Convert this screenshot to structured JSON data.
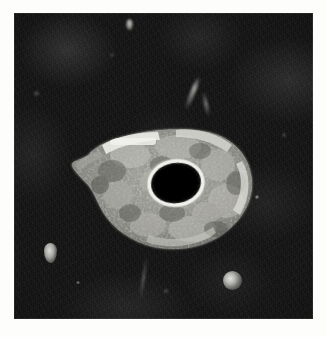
{
  "figure": {
    "domain": "Natural-Image",
    "kind": "grayscale-photomicrograph",
    "caption": "",
    "plate": {
      "left": 14,
      "top": 13,
      "width": 299,
      "height": 306,
      "page_background_color": "#fdfdfc",
      "background_color": "#0d0d0d",
      "background_description": "very dark, finely granular mottled field with horizontal scan striations"
    },
    "subject": {
      "name": "cell",
      "shape": "teardrop / pear shaped with a tapering tail to the upper left",
      "cytoplasm_color": "#9a9a95",
      "cytoplasm_description": "coarsely granular mid-gray cytoplasm with lighter and darker patches",
      "rim_color": "#e6e6e1",
      "rim_description": "bright highlighted rim, strongest as a horizontal streak along the upper-left margin and along the right margin",
      "bounds": {
        "left": 52,
        "top": 108,
        "width": 190,
        "height": 132
      }
    },
    "nucleus": {
      "name": "nucleus",
      "color": "#000000",
      "halo_color": "#efefea",
      "description": "dense black ellipse, tilted slightly, encircled by a bright halo ring",
      "center": {
        "x": 110,
        "y": 62
      },
      "radius": {
        "x": 25,
        "y": 20
      }
    },
    "particles": [
      {
        "name": "particle-left",
        "color": "#d8d8d4",
        "description": "small elongated bright granule, lower left field"
      },
      {
        "name": "particle-bottom-right",
        "color": "#e2e2de",
        "description": "round bright granule, lower right field"
      },
      {
        "name": "particle-top-center",
        "color": "#cfcfca",
        "description": "faint bright fleck, upper field"
      },
      {
        "name": "streak-upper-right",
        "color": "#c4c4c0",
        "description": "faint diagonal bright streak, upper right field"
      },
      {
        "name": "streak-lower-center",
        "color": "#a5a5a0",
        "description": "faint vertical bright streak below the cell"
      }
    ]
  }
}
